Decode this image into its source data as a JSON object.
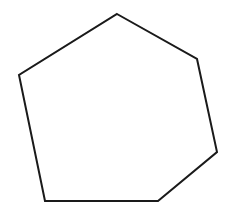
{
  "canvas": {
    "width": 238,
    "height": 216,
    "background_color": "#ffffff"
  },
  "figure": {
    "name": "hexagon-outline",
    "shape_type": "polygon",
    "sides": 6,
    "label": "Irregular hexagon outline",
    "fill_color": "#ffffff",
    "stroke_color": "#1a1a1a",
    "stroke_width": 2,
    "closed": true,
    "vertices": [
      {
        "id": "top",
        "x": 117,
        "y": 14
      },
      {
        "id": "upper-right",
        "x": 197,
        "y": 59
      },
      {
        "id": "lower-right",
        "x": 217,
        "y": 152
      },
      {
        "id": "bottom-right",
        "x": 158,
        "y": 201
      },
      {
        "id": "bottom-left",
        "x": 45,
        "y": 201
      },
      {
        "id": "left",
        "x": 19,
        "y": 75
      }
    ],
    "points_string": "117,14 197,59 217,152 158,201 45,201 19,75",
    "edges": [
      {
        "id": "edge-top-right",
        "from": "top",
        "to": "upper-right"
      },
      {
        "id": "edge-right",
        "from": "upper-right",
        "to": "lower-right"
      },
      {
        "id": "edge-bottom-right",
        "from": "lower-right",
        "to": "bottom-right"
      },
      {
        "id": "edge-bottom",
        "from": "bottom-right",
        "to": "bottom-left"
      },
      {
        "id": "edge-left",
        "from": "bottom-left",
        "to": "left"
      },
      {
        "id": "edge-top-left",
        "from": "left",
        "to": "top"
      }
    ]
  }
}
